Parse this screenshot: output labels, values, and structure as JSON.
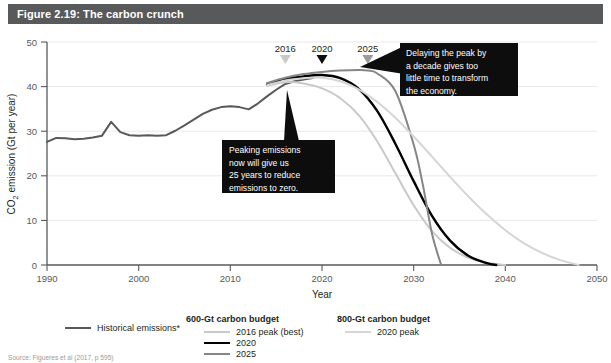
{
  "header": {
    "title": "Figure 2.19: The carbon crunch"
  },
  "source": {
    "note": "Source: Figueres et al (2017, p 595)"
  },
  "legend": {
    "historical": {
      "label": "Historical emissions*",
      "color": "#58595b"
    },
    "group_600": {
      "heading": "600-Gt carbon budget",
      "items": [
        {
          "label": "2016 peak (best)",
          "color": "#c9c9c9"
        },
        {
          "label": "2020",
          "color": "#000000"
        },
        {
          "label": "2025",
          "color": "#868686"
        }
      ]
    },
    "group_800": {
      "heading": "800-Gt carbon budget",
      "items": [
        {
          "label": "2020 peak",
          "color": "#d5d5d5"
        }
      ]
    }
  },
  "annotations": [
    {
      "id": "peaking-now",
      "lines": [
        "Peaking emissions",
        "now will give us",
        "25 years to reduce",
        "emissions to zero."
      ]
    },
    {
      "id": "delaying-peak",
      "lines": [
        "Delaying the peak by",
        "a decade gives too",
        "little time to transform",
        "the economy."
      ]
    }
  ],
  "peak_markers": [
    {
      "year": "2016",
      "x": 2016,
      "color": "#c9c9c9"
    },
    {
      "year": "2020",
      "x": 2020,
      "color": "#0d0d0d"
    },
    {
      "year": "2025",
      "x": 2025,
      "color": "#9a9a9a"
    }
  ],
  "chart_data": {
    "type": "line",
    "title": "Figure 2.19: The carbon crunch",
    "xlabel": "Year",
    "ylabel": "CO₂ emission (Gt per year)",
    "xlim": [
      1990,
      2050
    ],
    "ylim": [
      0,
      50
    ],
    "xticks": [
      1990,
      2000,
      2010,
      2020,
      2030,
      2040,
      2050
    ],
    "yticks": [
      0,
      10,
      20,
      30,
      40,
      50
    ],
    "grid": "horizontal",
    "legend_position": "below",
    "series": [
      {
        "name": "Historical emissions*",
        "color": "#58595b",
        "width": 2.0,
        "x": [
          1990,
          1991,
          1992,
          1993,
          1994,
          1995,
          1996,
          1997,
          1998,
          1999,
          2000,
          2001,
          2002,
          2003,
          2004,
          2005,
          2006,
          2007,
          2008,
          2009,
          2010,
          2011,
          2012,
          2013,
          2014,
          2015,
          2016,
          2017,
          2018,
          2019
        ],
        "y": [
          27.6,
          28.5,
          28.4,
          28.2,
          28.3,
          28.6,
          29.0,
          32.1,
          29.8,
          29.1,
          29.0,
          29.1,
          29.0,
          29.1,
          30.1,
          31.3,
          32.6,
          33.9,
          34.8,
          35.4,
          35.6,
          35.4,
          34.9,
          36.2,
          37.8,
          39.3,
          40.6,
          41.2,
          41.6,
          41.9
        ]
      },
      {
        "name": "600-Gt: 2016 peak (best)",
        "color": "#c9c9c9",
        "width": 2.0,
        "x": [
          2014,
          2016,
          2018,
          2020,
          2022,
          2024,
          2026,
          2028,
          2030,
          2032,
          2034,
          2036,
          2038,
          2040
        ],
        "y": [
          40.2,
          41.0,
          40.7,
          39.6,
          37.4,
          33.6,
          27.8,
          20.6,
          13.4,
          7.6,
          3.8,
          1.6,
          0.5,
          0.0
        ]
      },
      {
        "name": "600-Gt: 2020",
        "color": "#000000",
        "width": 2.4,
        "x": [
          2014,
          2016,
          2018,
          2020,
          2022,
          2024,
          2026,
          2028,
          2030,
          2032,
          2034,
          2036,
          2038,
          2039
        ],
        "y": [
          40.5,
          41.7,
          42.3,
          42.6,
          41.9,
          39.5,
          34.6,
          27.2,
          18.8,
          11.0,
          5.4,
          2.0,
          0.4,
          0.0
        ]
      },
      {
        "name": "600-Gt: 2025",
        "color": "#868686",
        "width": 2.0,
        "x": [
          2014,
          2016,
          2018,
          2020,
          2022,
          2024,
          2025,
          2026,
          2028,
          2030,
          2031,
          2032,
          2033
        ],
        "y": [
          40.8,
          42.0,
          42.8,
          43.3,
          43.6,
          43.7,
          43.6,
          43.0,
          39.0,
          27.0,
          18.0,
          7.0,
          0.0
        ]
      },
      {
        "name": "800-Gt: 2020 peak",
        "color": "#d5d5d5",
        "width": 2.0,
        "x": [
          2014,
          2016,
          2018,
          2020,
          2022,
          2024,
          2026,
          2028,
          2030,
          2032,
          2034,
          2036,
          2038,
          2040,
          2042,
          2044,
          2046,
          2048
        ],
        "y": [
          40.3,
          41.4,
          41.9,
          42.0,
          41.2,
          39.4,
          36.6,
          33.0,
          28.8,
          24.3,
          19.7,
          15.3,
          11.3,
          7.8,
          4.9,
          2.7,
          1.1,
          0.0
        ]
      }
    ]
  }
}
